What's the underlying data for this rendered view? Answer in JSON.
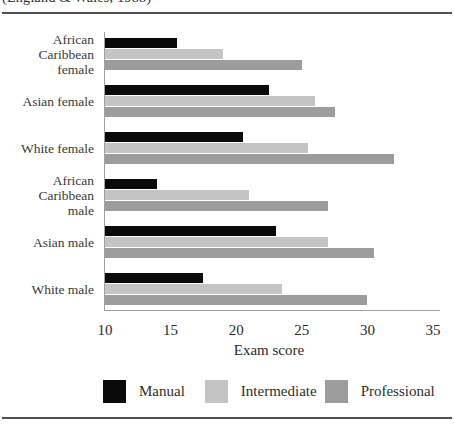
{
  "caption_clipped": "(England & Wales, 1988)",
  "colors": {
    "manual": "#0a0a0a",
    "intermediate": "#c4c4c4",
    "professional": "#9c9c9c",
    "axis": "#a0a0a0",
    "rule": "#4f4f4f",
    "text": "#2e2e2e"
  },
  "chart_data": {
    "type": "bar",
    "orientation": "horizontal",
    "title": "",
    "xlabel": "Exam score",
    "ylabel": "",
    "xlim": [
      10,
      35
    ],
    "xticks": [
      "10",
      "15",
      "20",
      "25",
      "30",
      "35"
    ],
    "grid": false,
    "legend_position": "bottom",
    "categories": [
      "African Caribbean female",
      "Asian female",
      "White female",
      "African Caribbean male",
      "Asian male",
      "White male"
    ],
    "category_label_lines": [
      [
        "African",
        "Caribbean",
        "female"
      ],
      [
        "Asian female"
      ],
      [
        "White female"
      ],
      [
        "African",
        "Caribbean",
        "male"
      ],
      [
        "Asian male"
      ],
      [
        "White male"
      ]
    ],
    "series": [
      {
        "name": "Manual",
        "color_key": "manual",
        "values": [
          15.5,
          22.5,
          20.5,
          14,
          23,
          17.5
        ]
      },
      {
        "name": "Intermediate",
        "color_key": "intermediate",
        "values": [
          19,
          26,
          25.5,
          21,
          27,
          23.5
        ]
      },
      {
        "name": "Professional",
        "color_key": "professional",
        "values": [
          25,
          27.5,
          32,
          27,
          30.5,
          30
        ]
      }
    ]
  }
}
